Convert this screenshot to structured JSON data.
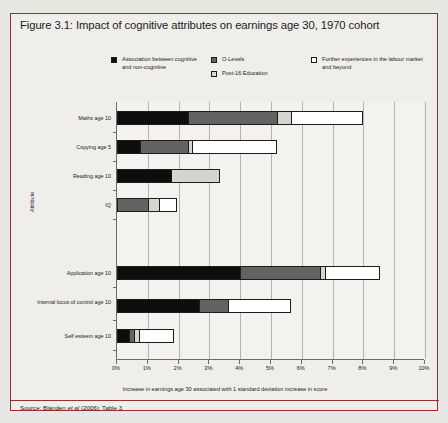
{
  "figure": {
    "title": "Figure 3.1: Impact of cognitive attributes on earnings age 30, 1970 cohort",
    "source": "Source: Blanden et al (2006): Table 3"
  },
  "legend": {
    "entries": [
      {
        "label": "Association between cognitive and non-cognitive",
        "swatch": "black",
        "icon": "legend-swatch-black",
        "color": "#0d0d0d"
      },
      {
        "label": "O-Levels",
        "swatch": "dark",
        "icon": "legend-swatch-dark-gray",
        "color": "#636363"
      },
      {
        "label": "Post-16 Education",
        "swatch": "light",
        "icon": "legend-swatch-light-gray",
        "color": "#d9d9d9"
      },
      {
        "label": "Further experiences in the labour market and beyond",
        "swatch": "white",
        "icon": "legend-swatch-white",
        "color": "#ffffff"
      }
    ]
  },
  "chart_data": {
    "type": "bar",
    "orientation": "horizontal",
    "stacked": true,
    "title": "Figure 3.1: Impact of cognitive attributes on earnings age 30, 1970 cohort",
    "xlabel": "Increase in earnings age 30 associated with 1 standard deviation increase in score",
    "ylabel": "Attribute",
    "xlim": [
      0,
      10
    ],
    "x_tick_labels": [
      "0%",
      "1%",
      "2%",
      "3%",
      "4%",
      "5%",
      "6%",
      "7%",
      "8%",
      "9%",
      "10%"
    ],
    "x_ticks": [
      0,
      1,
      2,
      3,
      4,
      5,
      6,
      7,
      8,
      9,
      10
    ],
    "grid": true,
    "legend_position": "top",
    "categories": [
      "Maths age 10",
      "Copying age 5",
      "Reading age 10",
      "IQ",
      "Application age 10",
      "Internal locus of control age 10",
      "Self esteem age 10"
    ],
    "series": [
      {
        "name": "Association between cognitive and non-cognitive",
        "color": "#0d0d0d",
        "values": [
          2.3,
          0.75,
          1.75,
          0.0,
          4.0,
          2.65,
          0.4
        ]
      },
      {
        "name": "O-Levels",
        "color": "#636363",
        "values": [
          2.9,
          1.55,
          0.0,
          1.0,
          2.6,
          0.95,
          0.15
        ]
      },
      {
        "name": "Post-16 Education",
        "color": "#d9d9d9",
        "values": [
          0.45,
          0.15,
          1.6,
          0.35,
          0.15,
          0.0,
          0.15
        ]
      },
      {
        "name": "Further experiences in the labour market and beyond",
        "color": "#ffffff",
        "values": [
          2.35,
          2.75,
          0.0,
          0.6,
          1.8,
          2.05,
          1.15
        ]
      }
    ],
    "totals": [
      8.0,
      5.2,
      3.35,
      1.95,
      8.55,
      5.65,
      1.85
    ]
  }
}
